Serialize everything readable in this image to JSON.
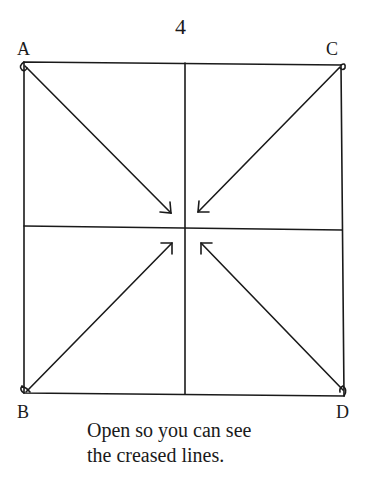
{
  "page_number": "4",
  "corners": {
    "top_left": "A",
    "top_right": "C",
    "bottom_left": "B",
    "bottom_right": "D"
  },
  "caption": {
    "line1": "Open so you can see",
    "line2": "the creased lines."
  },
  "diagram": {
    "shape": "square",
    "creases": [
      "vertical-center",
      "horizontal-center"
    ],
    "arrows": [
      "A-to-center",
      "C-to-center",
      "B-to-center",
      "D-to-center"
    ],
    "stroke_color": "#1a1a1a"
  }
}
